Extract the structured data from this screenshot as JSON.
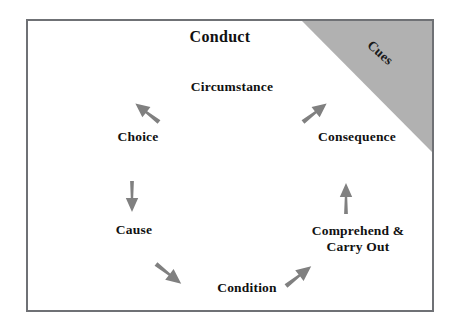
{
  "diagram": {
    "title": "Conduct",
    "corner_label": "Cues",
    "colors": {
      "frame_border": "#6f7175",
      "wedge_fill": "#b1b1b1",
      "arrow_fill": "#808080",
      "text": "#111111",
      "background": "#ffffff"
    },
    "nodes": [
      {
        "id": "circumstance",
        "label": "Circumstance"
      },
      {
        "id": "consequence",
        "label": "Consequence"
      },
      {
        "id": "comprehend",
        "label_line1": "Comprehend &",
        "label_line2": "Carry Out"
      },
      {
        "id": "condition",
        "label": "Condition"
      },
      {
        "id": "cause",
        "label": "Cause"
      },
      {
        "id": "choice",
        "label": "Choice"
      }
    ],
    "arrows": [
      {
        "id": "circumstance-to-choice",
        "direction": "down-left"
      },
      {
        "id": "choice-to-cause",
        "direction": "down"
      },
      {
        "id": "cause-to-condition",
        "direction": "down-right"
      },
      {
        "id": "condition-to-comprehend",
        "direction": "up-right"
      },
      {
        "id": "comprehend-to-consequence",
        "direction": "up"
      },
      {
        "id": "consequence-to-circumstance",
        "direction": "up-left"
      }
    ]
  }
}
